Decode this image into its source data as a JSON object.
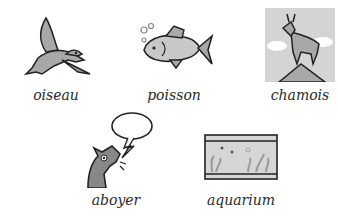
{
  "cards": [
    {
      "word": "oiseau",
      "icon": "bird-icon"
    },
    {
      "word": "poisson",
      "icon": "fish-icon"
    },
    {
      "word": "chamois",
      "icon": "chamois-icon"
    },
    {
      "word": "aboyer",
      "icon": "barking-dog-icon"
    },
    {
      "word": "aquarium",
      "icon": "aquarium-icon"
    }
  ],
  "colors": {
    "fill_gray": "#a8a8a8",
    "panel_bg": "#d4d4d4",
    "outline": "#222222",
    "text": "#2a2a2a"
  }
}
